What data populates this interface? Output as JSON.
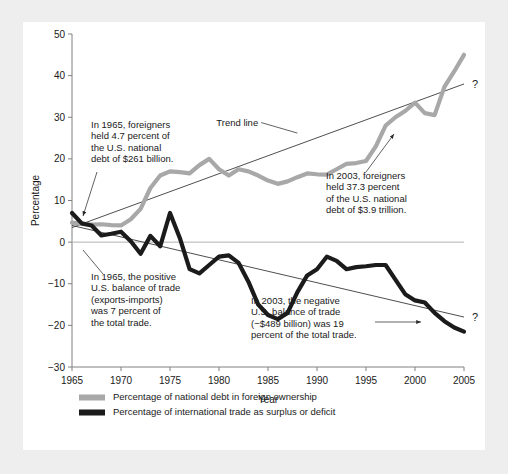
{
  "chart_data": {
    "type": "line",
    "title": "",
    "xlabel": "Year",
    "ylabel": "Percentage",
    "xlim": [
      1965,
      2005
    ],
    "ylim": [
      -30,
      50
    ],
    "xticks": [
      1965,
      1970,
      1975,
      1980,
      1985,
      1990,
      1995,
      2000,
      2005
    ],
    "yticks": [
      -30,
      -20,
      -10,
      0,
      10,
      20,
      30,
      40,
      50
    ],
    "grid": false,
    "legend_position": "bottom-left",
    "x": [
      1965,
      1966,
      1967,
      1968,
      1969,
      1970,
      1971,
      1972,
      1973,
      1974,
      1975,
      1976,
      1977,
      1978,
      1979,
      1980,
      1981,
      1982,
      1983,
      1984,
      1985,
      1986,
      1987,
      1988,
      1989,
      1990,
      1991,
      1992,
      1993,
      1994,
      1995,
      1996,
      1997,
      1998,
      1999,
      2000,
      2001,
      2002,
      2003,
      2004,
      2005
    ],
    "series": [
      {
        "name": "Percentage of national debt in foreign ownership",
        "color": "#a8a8a8",
        "values": [
          4.7,
          4.4,
          4.2,
          4.3,
          4.1,
          4.0,
          5.5,
          8.0,
          13.0,
          16.0,
          17.0,
          16.8,
          16.5,
          18.5,
          20.0,
          17.5,
          16.0,
          17.5,
          17.0,
          16.0,
          14.8,
          14.0,
          14.6,
          15.6,
          16.5,
          16.3,
          16.2,
          17.5,
          18.8,
          19.0,
          19.5,
          23.0,
          28.0,
          30.0,
          31.5,
          33.5,
          31.0,
          30.5,
          37.3,
          41.0,
          45.0
        ]
      },
      {
        "name": "Percentage of international trade as surplus or deficit",
        "color": "#1b1b1b",
        "values": [
          7.0,
          4.5,
          4.0,
          1.6,
          2.0,
          2.5,
          0.2,
          -2.8,
          1.5,
          -1.0,
          7.0,
          1.0,
          -6.5,
          -7.5,
          -5.5,
          -3.5,
          -3.2,
          -5.0,
          -9.5,
          -15.0,
          -17.5,
          -18.5,
          -17.0,
          -12.0,
          -8.0,
          -6.5,
          -3.5,
          -4.5,
          -6.5,
          -6.0,
          -5.8,
          -5.5,
          -5.5,
          -9.0,
          -12.5,
          -14.0,
          -14.5,
          -17.0,
          -19.0,
          -20.5,
          -21.5
        ]
      }
    ],
    "trendlines": [
      {
        "name": "debt-trend",
        "x": [
          1965,
          2005
        ],
        "y": [
          3.5,
          38.0
        ],
        "label": "Trend line",
        "end_marker": "?"
      },
      {
        "name": "trade-trend",
        "x": [
          1965,
          2005
        ],
        "y": [
          4.0,
          -18.0
        ],
        "label": "",
        "end_marker": "?"
      }
    ],
    "annotations": [
      {
        "id": "debt-1965",
        "lines": [
          "In 1965, foreigners",
          "held 4.7 percent of",
          "the U.S. national",
          "debt of $261 billion."
        ],
        "target_x": 1965,
        "target_y": 4.7
      },
      {
        "id": "debt-2003",
        "lines": [
          "In 2003, foreigners",
          "held 37.3 percent",
          "of the U.S. national",
          "debt of $3.9 trillion."
        ],
        "target_x": 2003,
        "target_y": 37.3
      },
      {
        "id": "trade-1965",
        "lines": [
          "In 1965, the positive",
          "U.S. balance of trade",
          "(exports-imports)",
          "was 7 percent of",
          "the total trade."
        ],
        "target_x": 1965,
        "target_y": 4.0
      },
      {
        "id": "trade-2003",
        "lines": [
          "In 2003, the negative",
          "U.S. balance of trade",
          "(−$489 billion) was 19",
          "percent of the total trade."
        ],
        "target_x": 2003,
        "target_y": -19.0
      }
    ],
    "legend": [
      {
        "label": "Percentage of national debt in foreign ownership",
        "color": "#a8a8a8"
      },
      {
        "label": "Percentage of international trade as surplus or deficit",
        "color": "#1b1b1b"
      }
    ]
  }
}
